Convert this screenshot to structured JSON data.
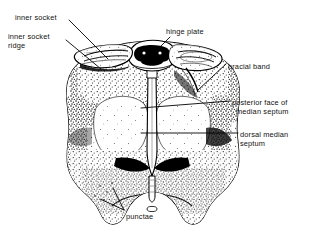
{
  "figure": {
    "style": "black-and-white stippled scientific line drawing",
    "background_color": "#ffffff",
    "ink_color": "#000000"
  },
  "labels": [
    {
      "id": "inner-socket",
      "text": "inner socket",
      "x": 15,
      "y": 14
    },
    {
      "id": "inner-socket-ridge-l1",
      "text": "inner socket",
      "x": 8,
      "y": 33
    },
    {
      "id": "inner-socket-ridge-l2",
      "text": "ridge",
      "x": 8,
      "y": 42
    },
    {
      "id": "hinge-plate",
      "text": "hinge plate",
      "x": 166,
      "y": 28
    },
    {
      "id": "bracial-band",
      "text": "bracial band",
      "x": 228,
      "y": 63
    },
    {
      "id": "posterior-face-l1",
      "text": "posterior face of",
      "x": 232,
      "y": 99
    },
    {
      "id": "posterior-face-l2",
      "text": "median septum",
      "x": 236,
      "y": 108
    },
    {
      "id": "dorsal-median-l1",
      "text": "dorsal median",
      "x": 240,
      "y": 131
    },
    {
      "id": "dorsal-median-l2",
      "text": "septum",
      "x": 240,
      "y": 140
    },
    {
      "id": "punctae",
      "text": "punctae",
      "x": 126,
      "y": 213
    }
  ],
  "leader_lines": [
    {
      "id": "leader-inner-socket",
      "from": [
        69,
        20
      ],
      "to": [
        108,
        59
      ]
    },
    {
      "id": "leader-inner-socket-ridge",
      "from": [
        66,
        40
      ],
      "to": [
        101,
        69
      ]
    },
    {
      "id": "leader-hinge-plate",
      "from": [
        170,
        37
      ],
      "to": [
        152,
        55
      ]
    },
    {
      "id": "leader-bracial-band",
      "from": [
        226,
        64
      ],
      "to": [
        198,
        90
      ]
    },
    {
      "id": "leader-posterior-face",
      "from": [
        230,
        101
      ],
      "to": [
        141,
        108
      ]
    },
    {
      "id": "leader-dorsal-median",
      "from": [
        238,
        133
      ],
      "to": [
        141,
        133
      ]
    },
    {
      "id": "leader-punctae-a",
      "from": [
        124,
        210
      ],
      "to": [
        113,
        188
      ]
    },
    {
      "id": "leader-punctae-b",
      "from": [
        124,
        210
      ],
      "to": [
        100,
        199
      ]
    }
  ]
}
